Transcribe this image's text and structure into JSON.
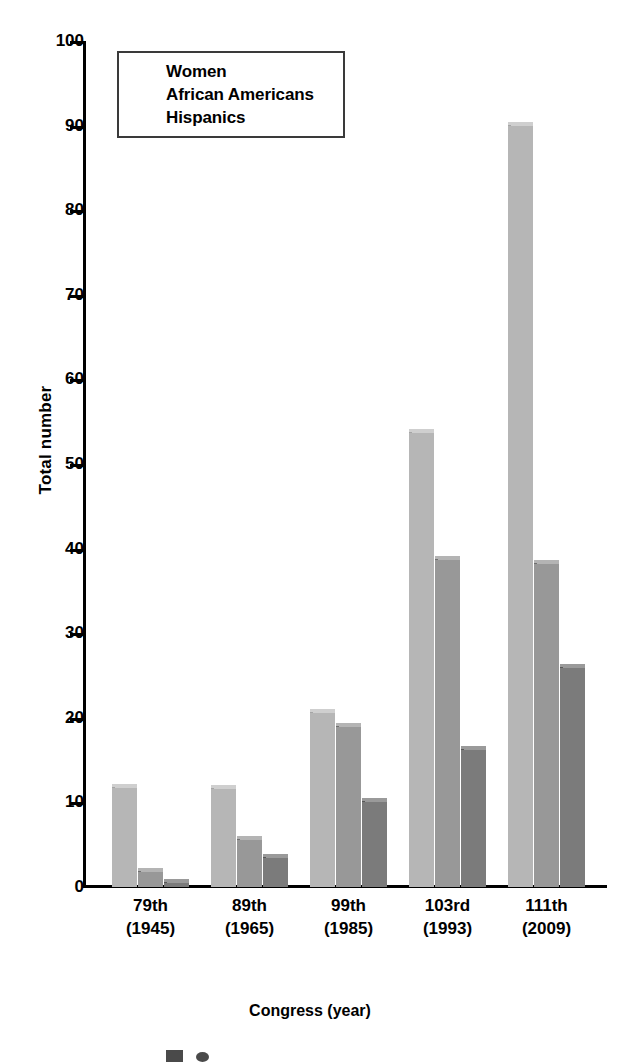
{
  "chart_data": {
    "type": "bar",
    "title": "",
    "xlabel": "Congress (year)",
    "ylabel": "Total number",
    "ylim": [
      0,
      100
    ],
    "ytick_step": 10,
    "yticks": [
      0,
      10,
      20,
      30,
      40,
      50,
      60,
      70,
      80,
      90,
      100
    ],
    "grid": false,
    "legend_position": "top-left",
    "categories": [
      "79th\n(1945)",
      "89th\n(1965)",
      "99th\n(1985)",
      "103rd\n(1993)",
      "111th\n(2009)"
    ],
    "category_lines": [
      {
        "line1": "79th",
        "line2": "(1945)"
      },
      {
        "line1": "89th",
        "line2": "(1965)"
      },
      {
        "line1": "99th",
        "line2": "(1985)"
      },
      {
        "line1": "103rd",
        "line2": "(1993)"
      },
      {
        "line1": "111th",
        "line2": "(2009)"
      }
    ],
    "series": [
      {
        "name": "Women",
        "color": "#b6b6b6",
        "values": [
          12.2,
          12.0,
          21.0,
          54.1,
          90.4
        ]
      },
      {
        "name": "African Americans",
        "color": "#989898",
        "values": [
          2.3,
          6.0,
          19.4,
          39.1,
          38.6
        ]
      },
      {
        "name": "Hispanics",
        "color": "#7b7b7b",
        "values": [
          1.0,
          3.9,
          10.5,
          16.7,
          26.4
        ]
      }
    ]
  },
  "axes": {
    "y_title": "Total number",
    "x_title": "Congress (year)",
    "y_tick_labels": [
      "100",
      "90",
      "80",
      "70",
      "60",
      "50",
      "40",
      "30",
      "20",
      "10",
      "0"
    ]
  },
  "legend": {
    "entries": [
      {
        "label": "Women",
        "swatch": "legend-swatch-women"
      },
      {
        "label": "African Americans",
        "swatch": "legend-swatch-african-americans"
      },
      {
        "label": "Hispanics",
        "swatch": "legend-swatch-hispanics"
      }
    ]
  }
}
